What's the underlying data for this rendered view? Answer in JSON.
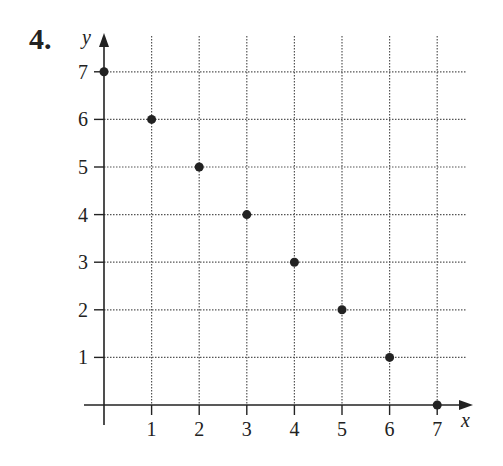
{
  "problem_number": "4.",
  "chart_data": {
    "type": "scatter",
    "title": "",
    "xlabel": "x",
    "ylabel": "y",
    "x": [
      0,
      1,
      2,
      3,
      4,
      5,
      6,
      7
    ],
    "y": [
      7,
      6,
      5,
      4,
      3,
      2,
      1,
      0
    ],
    "xticks": [
      "1",
      "2",
      "3",
      "4",
      "5",
      "6",
      "7"
    ],
    "yticks": [
      "1",
      "2",
      "3",
      "4",
      "5",
      "6",
      "7"
    ],
    "xlim": [
      0,
      7
    ],
    "ylim": [
      0,
      7
    ],
    "grid": true,
    "grid_style": "dotted",
    "legend": null,
    "point_color": "#222222"
  }
}
